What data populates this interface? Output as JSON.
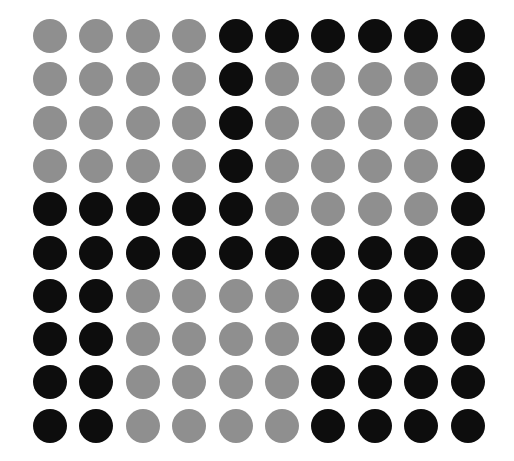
{
  "grid": {
    "rows": 10,
    "cols": 10,
    "origin_center": [
      50,
      36
    ],
    "spacing": [
      46.4,
      43.3
    ],
    "dot_diameter": 34,
    "colors": {
      "G": "#8f8f8f",
      "B": "#0d0d0d"
    },
    "pattern": [
      "GGGGBBBBBB",
      "GGGGBGGGGB",
      "GGGGBGGGGB",
      "GGGGBGGGGB",
      "BBBBBGGGGB",
      "BBBBBBBBBB",
      "BBGGGGBBBB",
      "BBGGGGBBBB",
      "BBGGGGBBBB",
      "BBGGGGBBBB"
    ]
  }
}
